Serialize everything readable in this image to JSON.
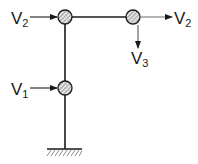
{
  "diagram": {
    "title": "",
    "colors": {
      "stroke": "#1a1a1a",
      "secondary_stroke": "#777777",
      "node_fill": "#d8d8d8",
      "hatch": "#555555",
      "background": "#ffffff"
    },
    "nodes": [
      {
        "id": "top-joint",
        "cx": 65,
        "cy": 17,
        "r": 7
      },
      {
        "id": "right-node",
        "cx": 133,
        "cy": 17,
        "r": 7
      },
      {
        "id": "mid-node",
        "cx": 65,
        "cy": 88,
        "r": 7
      }
    ],
    "members": [
      {
        "id": "column-upper",
        "from": "top-joint",
        "to": "mid-node"
      },
      {
        "id": "column-lower",
        "from": "mid-node",
        "to": "ground"
      },
      {
        "id": "beam",
        "from": "top-joint",
        "to": "right-node"
      }
    ],
    "support": {
      "type": "fixed-ground",
      "x": 65,
      "y": 149
    },
    "loads": [
      {
        "id": "v2-left",
        "label_main": "V",
        "label_sub": "2",
        "direction": "right",
        "target": "top-joint"
      },
      {
        "id": "v2-right",
        "label_main": "V",
        "label_sub": "2",
        "direction": "right",
        "target": "right-node"
      },
      {
        "id": "v3-down",
        "label_main": "V",
        "label_sub": "3",
        "direction": "down",
        "target": "right-node"
      },
      {
        "id": "v1-left",
        "label_main": "V",
        "label_sub": "1",
        "direction": "right",
        "target": "mid-node"
      }
    ]
  }
}
